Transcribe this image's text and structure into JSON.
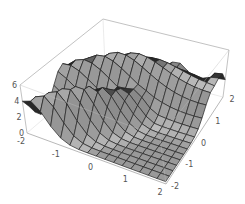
{
  "chart_data": {
    "type": "surface3d",
    "title": "",
    "xlabel": "",
    "ylabel": "",
    "zlabel": "",
    "x_range": [
      -2,
      2
    ],
    "y_range": [
      -2,
      2
    ],
    "z_range": [
      0,
      6
    ],
    "x_ticks": [
      "-2",
      "-1",
      "0",
      "1",
      "2"
    ],
    "y_ticks": [
      "-2",
      "-1",
      "0",
      "1",
      "2"
    ],
    "z_ticks": [
      "0",
      "2",
      "4",
      "6"
    ],
    "grid_mesh": 16,
    "box": true,
    "surface_color": "#8a8a8a",
    "mesh_color": "#222222",
    "box_color": "#999999"
  }
}
